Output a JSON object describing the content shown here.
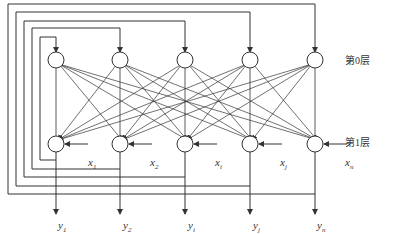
{
  "diagram": {
    "type": "hopfield-network",
    "layers": [
      {
        "label": "第0层",
        "x": 345,
        "y": 57
      },
      {
        "label": "第1层",
        "x": 345,
        "y": 138
      }
    ],
    "nodes_x": [
      56,
      120,
      185,
      250,
      315
    ],
    "layer0_y": 60,
    "layer1_y": 144,
    "node_radius": 8,
    "inputs": [
      {
        "name": "x",
        "sub": "1",
        "x": 88,
        "y": 157
      },
      {
        "name": "x",
        "sub": "2",
        "x": 150,
        "y": 157
      },
      {
        "name": "x",
        "sub": "i",
        "x": 215,
        "y": 157
      },
      {
        "name": "x",
        "sub": "j",
        "x": 280,
        "y": 157
      },
      {
        "name": "x",
        "sub": "n",
        "x": 345,
        "y": 157
      }
    ],
    "outputs": [
      {
        "name": "y",
        "sub": "1",
        "x": 58,
        "y": 220
      },
      {
        "name": "y",
        "sub": "2",
        "x": 123,
        "y": 220
      },
      {
        "name": "y",
        "sub": "i",
        "x": 188,
        "y": 220
      },
      {
        "name": "y",
        "sub": "j",
        "x": 253,
        "y": 220
      },
      {
        "name": "y",
        "sub": "n",
        "x": 317,
        "y": 220
      }
    ],
    "feedback": [
      {
        "node": 0,
        "left_x": 40,
        "top_y": 37,
        "bottom_y": 160
      },
      {
        "node": 1,
        "left_x": 32,
        "top_y": 28,
        "bottom_y": 169
      },
      {
        "node": 2,
        "left_x": 24,
        "top_y": 21,
        "bottom_y": 177
      },
      {
        "node": 3,
        "left_x": 16,
        "top_y": 12,
        "bottom_y": 186
      },
      {
        "node": 4,
        "left_x": 8,
        "top_y": 4,
        "bottom_y": 194
      }
    ],
    "stroke_color": "#333333"
  }
}
